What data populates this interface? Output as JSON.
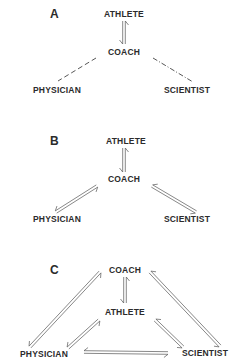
{
  "panels": [
    {
      "label": "A",
      "nodes": {
        "athlete": "ATHLETE",
        "coach": "COACH",
        "physician": "PHYSICIAN",
        "scientist": "SCIENTIST"
      },
      "links": [
        {
          "from": "coach",
          "to": "athlete",
          "style": "double-arrow"
        },
        {
          "from": "coach",
          "to": "physician",
          "style": "dashed"
        },
        {
          "from": "coach",
          "to": "scientist",
          "style": "dash-dot"
        }
      ]
    },
    {
      "label": "B",
      "nodes": {
        "athlete": "ATHLETE",
        "coach": "COACH",
        "physician": "PHYSICIAN",
        "scientist": "SCIENTIST"
      },
      "links": [
        {
          "from": "coach",
          "to": "athlete",
          "style": "double-arrow"
        },
        {
          "from": "coach",
          "to": "physician",
          "style": "double-arrow"
        },
        {
          "from": "coach",
          "to": "scientist",
          "style": "double-arrow"
        }
      ]
    },
    {
      "label": "C",
      "nodes": {
        "athlete": "ATHLETE",
        "coach": "COACH",
        "physician": "PHYSICIAN",
        "scientist": "SCIENTIST"
      },
      "links": [
        {
          "from": "coach",
          "to": "athlete",
          "style": "double-arrow"
        },
        {
          "from": "coach",
          "to": "physician",
          "style": "double-arrow"
        },
        {
          "from": "coach",
          "to": "scientist",
          "style": "double-arrow"
        },
        {
          "from": "athlete",
          "to": "physician",
          "style": "double-arrow"
        },
        {
          "from": "athlete",
          "to": "scientist",
          "style": "double-arrow"
        },
        {
          "from": "physician",
          "to": "scientist",
          "style": "double-arrow"
        }
      ]
    }
  ]
}
